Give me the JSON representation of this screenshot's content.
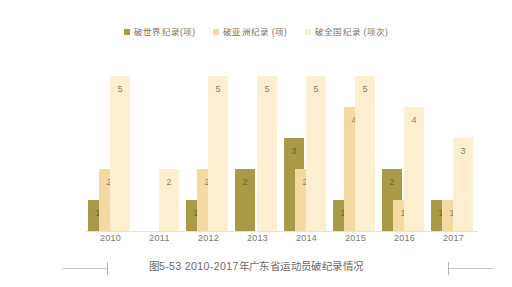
{
  "figure": {
    "caption": "图5-53  2010-2017年广东省运动员破纪录情况"
  },
  "legend": {
    "position": "top-center",
    "items": [
      {
        "label": "破世界纪录(项)",
        "color": "#a89a46",
        "swatch_name": "legend-swatch-world"
      },
      {
        "label": "破亚洲纪录 (项)",
        "color": "#f2daa2",
        "swatch_name": "legend-swatch-asia"
      },
      {
        "label": "破全国纪录 (项次)",
        "color": "#fbefd0",
        "swatch_name": "legend-swatch-national"
      }
    ]
  },
  "chart_data": {
    "type": "bar",
    "title": "图5-53  2010-2017年广东省运动员破纪录情况",
    "xlabel": "",
    "ylabel": "",
    "ylim": [
      0,
      5
    ],
    "grid": false,
    "legend_position": "top-center",
    "categories": [
      "2010",
      "2011",
      "2012",
      "2013",
      "2014",
      "2015",
      "2016",
      "2017"
    ],
    "series": [
      {
        "name": "破世界纪录(项)",
        "color": "#a89a46",
        "values": [
          1,
          0,
          1,
          2,
          3,
          1,
          2,
          1
        ],
        "labels": [
          "1",
          "",
          "1",
          "2",
          "3",
          "1",
          "2",
          "1"
        ]
      },
      {
        "name": "破亚洲纪录 (项)",
        "color": "#f2daa2",
        "values": [
          2,
          0,
          2,
          0,
          2,
          4,
          1,
          1
        ],
        "labels": [
          "2",
          "",
          "2",
          "",
          "2",
          "4",
          "1",
          "1"
        ]
      },
      {
        "name": "破全国纪录 (项次)",
        "color": "#fbefd0",
        "values": [
          5,
          2,
          5,
          5,
          5,
          5,
          4,
          3
        ],
        "labels": [
          "5",
          "2",
          "5",
          "5",
          "5",
          "5",
          "4",
          "3"
        ]
      }
    ]
  },
  "axis": {
    "ticks": [
      "2010",
      "2011",
      "2012",
      "2013",
      "2014",
      "2015",
      "2016",
      "2017"
    ]
  }
}
